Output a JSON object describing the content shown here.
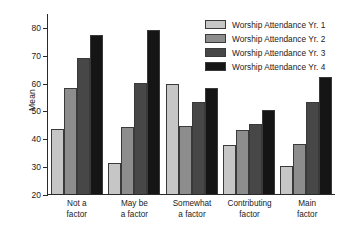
{
  "chart_data": {
    "type": "bar",
    "title": "",
    "xlabel": "",
    "ylabel": "Mean",
    "ylim": [
      20,
      85
    ],
    "yticks": [
      20,
      30,
      40,
      50,
      60,
      70,
      80
    ],
    "grid": false,
    "legend_position": "top-right",
    "categories": [
      "Not a\nfactor",
      "May be\na factor",
      "Somewhat\na factor",
      "Contributing\nfactor",
      "Main\nfactor"
    ],
    "category_lines": [
      [
        "Not a",
        "factor"
      ],
      [
        "May be",
        "a factor"
      ],
      [
        "Somewhat",
        "a factor"
      ],
      [
        "Contributing",
        "factor"
      ],
      [
        "Main",
        "factor"
      ]
    ],
    "series": [
      {
        "name": "Worship Attendance Yr. 1",
        "color": "#c6c6c6",
        "values": [
          43.5,
          31.0,
          59.5,
          37.5,
          30.0
        ]
      },
      {
        "name": "Worship Attendance Yr. 2",
        "color": "#8d8d8d",
        "values": [
          58.0,
          44.0,
          44.5,
          43.0,
          38.0
        ]
      },
      {
        "name": "Worship Attendance Yr. 3",
        "color": "#474747",
        "values": [
          69.0,
          60.0,
          53.0,
          45.0,
          53.0
        ]
      },
      {
        "name": "Worship Attendance Yr. 4",
        "color": "#151515",
        "values": [
          77.0,
          79.0,
          58.0,
          50.0,
          62.0
        ]
      }
    ]
  },
  "legend": {
    "items": [
      "Worship Attendance Yr. 1",
      "Worship Attendance Yr. 2",
      "Worship Attendance Yr. 3",
      "Worship Attendance Yr. 4"
    ]
  },
  "axis": {
    "ylabel": "Mean",
    "ytick_labels": [
      "20",
      "30",
      "40",
      "50",
      "60",
      "70",
      "80"
    ]
  },
  "caption": {
    "sliver_text": ""
  }
}
